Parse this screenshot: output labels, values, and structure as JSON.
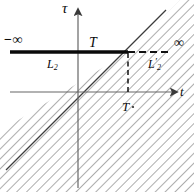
{
  "figure": {
    "type": "math-diagram",
    "axes": {
      "vertical_label": "τ",
      "horizontal_label": "t",
      "origin": {
        "x": 78,
        "y": 92
      }
    },
    "labels": {
      "neg_infinity": "−∞",
      "pos_infinity": "∞",
      "tau_axis_T": "T",
      "t_axis_T": "T",
      "segment_left": {
        "base": "L",
        "sub": "2",
        "prime": ""
      },
      "segment_right": {
        "base": "L",
        "sub": "2",
        "prime": "′"
      }
    },
    "colors": {
      "ink": "#0a0a0a",
      "axis": "#555555",
      "hatch": "#707070",
      "dashed": "#1a1a1a",
      "background": "#ffffff"
    },
    "geometry": {
      "tau_axis_x": 78,
      "t_axis_y": 92,
      "thick_line_y": 52,
      "thick_line_x_start": 10,
      "thick_line_x_end": 128,
      "intersection": {
        "x": 128,
        "y": 52
      },
      "diagonal_slope": 1,
      "dashed_horizontal_x_end": 172,
      "hatch_spacing_px": 7,
      "hatch_angle_deg": 45
    }
  }
}
